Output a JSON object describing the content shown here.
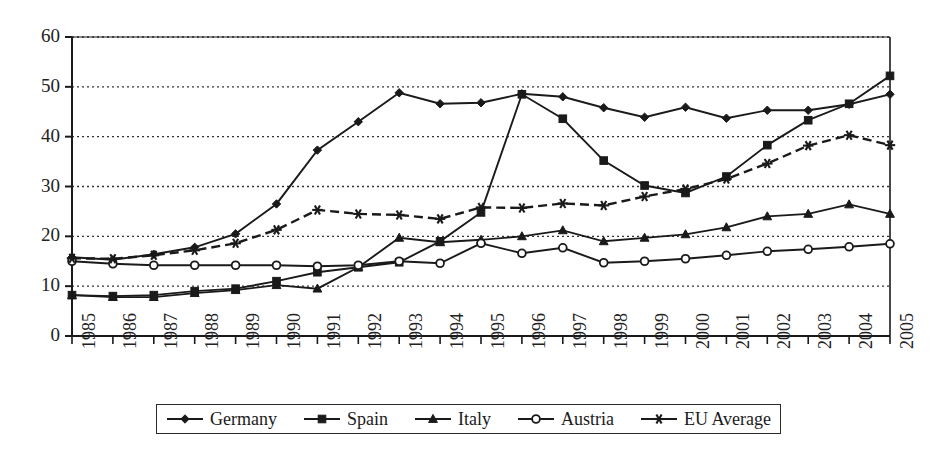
{
  "chart_data": {
    "type": "line",
    "title": "",
    "xlabel": "",
    "ylabel": "",
    "xlim": [
      1985,
      2005
    ],
    "ylim": [
      0,
      60
    ],
    "yticks": [
      0,
      10,
      20,
      30,
      40,
      50,
      60
    ],
    "grid": "horizontal-dotted",
    "legend_position": "bottom-center",
    "categories": [
      "1985",
      "1986",
      "1987",
      "1988",
      "1989",
      "1990",
      "1991",
      "1992",
      "1993",
      "1994",
      "1995",
      "1996",
      "1997",
      "1998",
      "1999",
      "2000",
      "2001",
      "2002",
      "2003",
      "2004",
      "2005"
    ],
    "series": [
      {
        "name": "Germany",
        "marker": "diamond",
        "line_style": "solid",
        "color": "#1a1a1a",
        "values": [
          15.8,
          15.3,
          16.4,
          17.8,
          20.5,
          26.5,
          37.3,
          43.0,
          48.8,
          46.6,
          46.8,
          48.6,
          48.0,
          45.8,
          43.9,
          45.9,
          43.7,
          45.3,
          45.3,
          46.5,
          48.5
        ]
      },
      {
        "name": "Spain",
        "marker": "square",
        "line_style": "solid",
        "color": "#1a1a1a",
        "values": [
          8.2,
          8.0,
          8.2,
          9.0,
          9.5,
          11.0,
          12.8,
          13.8,
          14.8,
          19.0,
          24.8,
          48.5,
          43.6,
          35.2,
          30.2,
          28.7,
          32.0,
          38.3,
          43.3,
          46.6,
          52.2
        ]
      },
      {
        "name": "Italy",
        "marker": "triangle",
        "line_style": "solid",
        "color": "#1a1a1a",
        "values": [
          8.2,
          7.8,
          7.8,
          8.6,
          9.2,
          10.2,
          9.5,
          13.8,
          19.7,
          18.8,
          19.3,
          20.0,
          21.2,
          19.0,
          19.7,
          20.4,
          21.8,
          24.0,
          24.5,
          26.4,
          24.5
        ]
      },
      {
        "name": "Austria",
        "marker": "circle",
        "line_style": "solid",
        "color": "#1a1a1a",
        "values": [
          15.0,
          14.5,
          14.2,
          14.2,
          14.2,
          14.2,
          14.0,
          14.2,
          15.0,
          14.6,
          18.6,
          16.6,
          17.7,
          14.7,
          15.0,
          15.5,
          16.2,
          17.0,
          17.4,
          17.9,
          18.5
        ]
      },
      {
        "name": "EU Average",
        "marker": "asterisk",
        "line_style": "dashed",
        "color": "#1a1a1a",
        "values": [
          15.6,
          15.5,
          16.2,
          17.2,
          18.6,
          21.3,
          25.3,
          24.5,
          24.3,
          23.5,
          25.8,
          25.7,
          26.6,
          26.2,
          28.0,
          29.5,
          31.5,
          34.6,
          38.2,
          40.3,
          38.3
        ]
      }
    ]
  },
  "legend": {
    "items": [
      {
        "label": "Germany",
        "marker": "diamond-marker-icon",
        "style": "solid"
      },
      {
        "label": "Spain",
        "marker": "square-marker-icon",
        "style": "solid"
      },
      {
        "label": "Italy",
        "marker": "triangle-marker-icon",
        "style": "solid"
      },
      {
        "label": "Austria",
        "marker": "circle-marker-icon",
        "style": "solid"
      },
      {
        "label": "EU Average",
        "marker": "asterisk-marker-icon",
        "style": "solid"
      }
    ]
  }
}
